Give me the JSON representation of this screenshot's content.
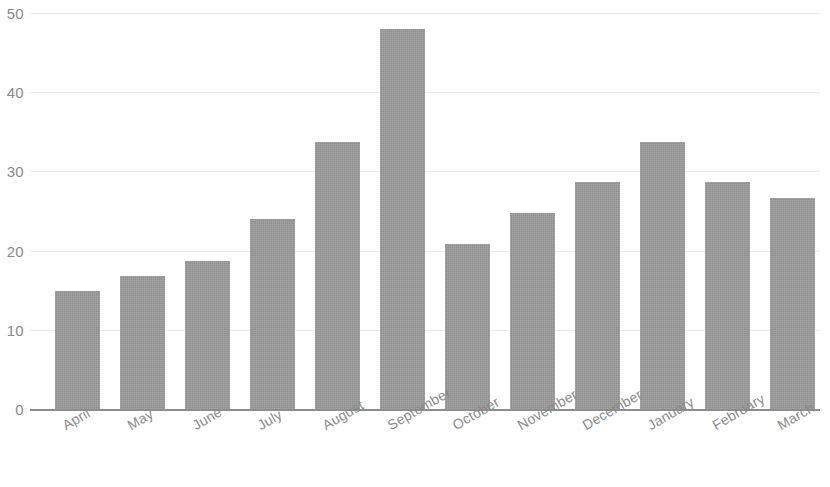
{
  "chart_data": {
    "type": "bar",
    "title": "",
    "subtitle": "",
    "xlabel": "",
    "ylabel": "",
    "categories": [
      "April",
      "May",
      "June",
      "July",
      "August",
      "September",
      "October",
      "November",
      "December",
      "January",
      "February",
      "March"
    ],
    "values": [
      14.9,
      16.8,
      18.7,
      24.0,
      33.7,
      48.0,
      20.8,
      24.7,
      28.7,
      33.7,
      28.7,
      26.7
    ],
    "series": [
      {
        "name": "",
        "values": [
          14.9,
          16.8,
          18.7,
          24.0,
          33.7,
          48.0,
          20.8,
          24.7,
          28.7,
          33.7,
          28.7,
          26.7
        ]
      }
    ],
    "ylim": [
      0,
      51.7
    ],
    "yticks": [
      0,
      10,
      20,
      30,
      40,
      50
    ],
    "ytick_labels": [
      "0",
      "10",
      "20",
      "30",
      "40",
      "50"
    ],
    "grid": true,
    "grid_axis": "y",
    "legend": false,
    "legend_position": "none",
    "bar_color": "#9a9a9a",
    "gridline_color": "#ececec",
    "axis_color": "#8d8d8d",
    "tick_label_color": "#8a8a8a",
    "xtick_rotation_deg": -30,
    "top_tick_clipped": true,
    "annotations": []
  }
}
